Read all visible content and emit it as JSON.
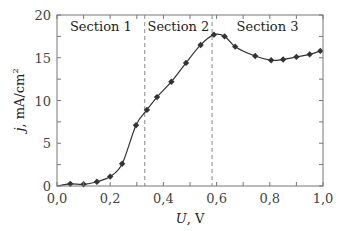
{
  "chart_data": {
    "type": "line",
    "title": "",
    "xlabel_var": "U",
    "xlabel_unit": ", V",
    "ylabel_var": "j",
    "ylabel_unit": ", mA/cm",
    "ylabel_sup": "2",
    "xlim": [
      0,
      1.0
    ],
    "ylim": [
      0,
      20
    ],
    "grid": false,
    "legend": null,
    "x_ticks": [
      0.0,
      0.2,
      0.4,
      0.6,
      0.8,
      1.0
    ],
    "x_tick_labels": [
      "0,0",
      "0,2",
      "0,4",
      "0,6",
      "0,8",
      "1,0"
    ],
    "x_minor_step": 0.1,
    "y_ticks": [
      0,
      5,
      10,
      15,
      20
    ],
    "y_tick_labels": [
      "0",
      "5",
      "10",
      "15",
      "20"
    ],
    "y_minor_step": 2.5,
    "series": [
      {
        "name": "j(U)",
        "marker": "diamond",
        "x": [
          0.05,
          0.1,
          0.15,
          0.2,
          0.245,
          0.297,
          0.338,
          0.376,
          0.43,
          0.485,
          0.54,
          0.59,
          0.63,
          0.67,
          0.745,
          0.805,
          0.85,
          0.9,
          0.95,
          0.99
        ],
        "y": [
          0.25,
          0.2,
          0.5,
          1.1,
          2.6,
          7.1,
          8.9,
          10.4,
          12.2,
          14.4,
          16.5,
          17.7,
          17.5,
          16.3,
          15.2,
          14.7,
          14.8,
          15.1,
          15.4,
          15.8
        ]
      }
    ],
    "vertical_dividers": [
      0.33,
      0.583
    ],
    "sections": [
      {
        "label": "Section 1",
        "x_start": 0.0,
        "x_end": 0.33
      },
      {
        "label": "Section 2",
        "x_start": 0.33,
        "x_end": 0.583
      },
      {
        "label": "Section 3",
        "x_start": 0.583,
        "x_end": 1.0
      }
    ]
  },
  "colors": {
    "axis": "#777777",
    "line": "#333333",
    "marker": "#333333",
    "divider": "#888888"
  }
}
